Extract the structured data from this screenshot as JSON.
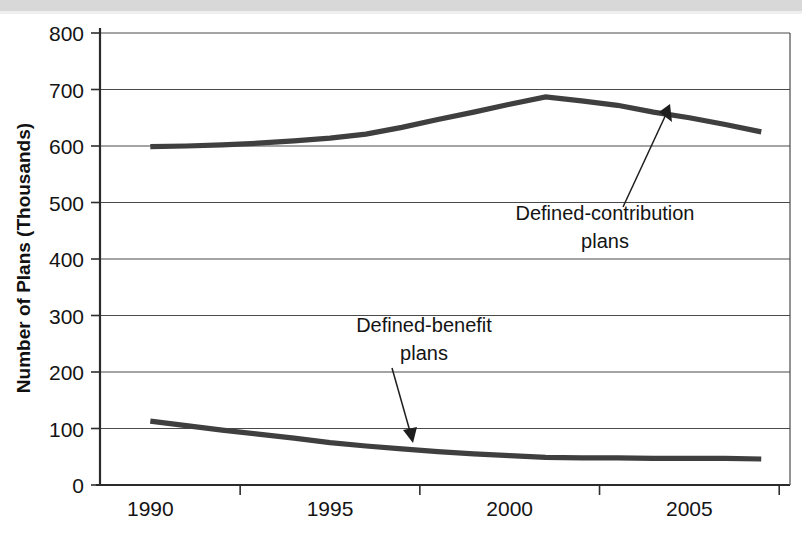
{
  "chart_data": {
    "type": "line",
    "title": "",
    "subtitle": "",
    "xlabel": "",
    "ylabel": "Number of Plans (Thousands)",
    "xlim": [
      1988.6,
      2007.8
    ],
    "ylim": [
      0,
      800
    ],
    "yticks": [
      0,
      100,
      200,
      300,
      400,
      500,
      600,
      700,
      800
    ],
    "ytick_labels": [
      "0",
      "100",
      "200",
      "300",
      "400",
      "500",
      "600",
      "700",
      "800"
    ],
    "xticks": [
      1990,
      1995,
      2000,
      2005
    ],
    "xtick_labels": [
      "1990",
      "1995",
      "2000",
      "2005"
    ],
    "grid": "horizontal",
    "legend_position": "none",
    "line_color": "#3f3f3f",
    "axis_color": "#333333",
    "series": [
      {
        "name": "Defined-contribution plans",
        "x": [
          1990,
          1991,
          1992,
          1993,
          1994,
          1995,
          1996,
          1997,
          1998,
          1999,
          2000,
          2001,
          2002,
          2003,
          2004,
          2005,
          2006,
          2007
        ],
        "values": [
          599,
          600,
          602,
          605,
          609,
          614,
          621,
          633,
          647,
          660,
          674,
          687,
          680,
          672,
          660,
          650,
          638,
          625
        ]
      },
      {
        "name": "Defined-benefit plans",
        "x": [
          1990,
          1991,
          1992,
          1993,
          1994,
          1995,
          1996,
          1997,
          1998,
          1999,
          2000,
          2001,
          2002,
          2003,
          2004,
          2005,
          2006,
          2007
        ],
        "values": [
          113,
          105,
          97,
          90,
          83,
          75,
          69,
          64,
          59,
          55,
          52,
          49,
          48,
          48,
          47,
          47,
          47,
          46
        ]
      }
    ],
    "annotations": [
      {
        "id": "defined-contribution-annotation",
        "line1": "Defined-contribution",
        "line2": "plans",
        "target_x": 2002.2,
        "target_y": 672
      },
      {
        "id": "defined-benefit-annotation",
        "line1": "Defined-benefit",
        "line2": "plans",
        "target_x": 1996.6,
        "target_y": 68
      }
    ]
  },
  "figure": {
    "background_color": "#ffffff",
    "scan_band_color": "#d8d8d8"
  }
}
